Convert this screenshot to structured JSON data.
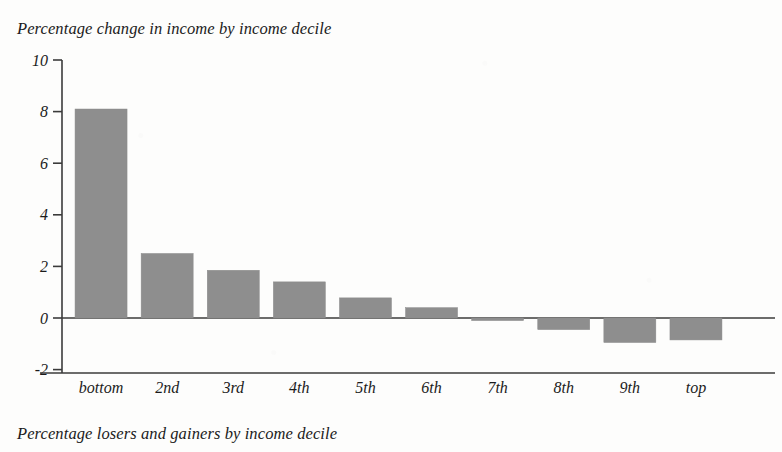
{
  "title": "Percentage change in income by income decile",
  "bottom_caption": "Percentage losers and gainers by income decile",
  "colors": {
    "bar_fill": "#8e8e8e",
    "axis": "#3b3b3b",
    "text": "#1b1b1b",
    "background": "#fdfdfc"
  },
  "axis": {
    "y_ticks": [
      "10",
      "8",
      "6",
      "4",
      "2",
      "0",
      "-2"
    ],
    "x_ticks": [
      "bottom",
      "2nd",
      "3rd",
      "4th",
      "5th",
      "6th",
      "7th",
      "8th",
      "9th",
      "top"
    ]
  },
  "chart_data": {
    "type": "bar",
    "title": "Percentage change in income by income decile",
    "xlabel": "",
    "ylabel": "",
    "ylim": [
      -2,
      10
    ],
    "yticks": [
      -2,
      0,
      2,
      4,
      6,
      8,
      10
    ],
    "grid": false,
    "legend": null,
    "categories": [
      "bottom",
      "2nd",
      "3rd",
      "4th",
      "5th",
      "6th",
      "7th",
      "8th",
      "9th",
      "top"
    ],
    "values": [
      8.1,
      2.5,
      1.85,
      1.4,
      0.78,
      0.4,
      -0.1,
      -0.45,
      -0.95,
      -0.85
    ]
  }
}
